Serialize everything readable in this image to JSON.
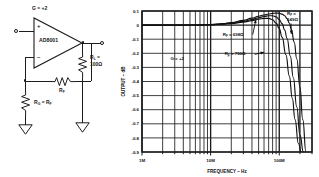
{
  "figure": {
    "kind": "datasheet-figure",
    "circuit": {
      "device_label": "AD8001",
      "gain_label": "G = +2",
      "input_terminal": "IN",
      "output_terminal": "OUT",
      "plus_label": "+",
      "minus_label": "–",
      "rf_label_main": "R",
      "rf_label_sub": "F",
      "rg_label": "R",
      "rg_label_sub": "G",
      "rg_equals": " = R",
      "rg_equals_sub": "F",
      "rl_label": "R",
      "rl_label_sub": "L",
      "rl_value_line1": " =",
      "rl_value_line2": "100Ω"
    }
  },
  "chart_data": {
    "type": "line",
    "title": "",
    "xlabel": "FREQUENCY – Hz",
    "ylabel": "OUTPUT – dB",
    "xscale": "log",
    "xlim": [
      1000000,
      300000000
    ],
    "ylim": [
      -0.9,
      0.1
    ],
    "grid": true,
    "legend": "inline-annotations",
    "annotations": [
      {
        "text_main": "G = +2",
        "x": 2600000,
        "y": -0.25,
        "arrow": false
      },
      {
        "text_main": "R",
        "text_sub": "F",
        "text_rest": " = 698Ω",
        "x": 15000000,
        "y": -0.075,
        "arrow": true,
        "arrow_to_x": 46000000,
        "arrow_to_y": 0.045
      },
      {
        "text_main": "R",
        "text_sub": "F",
        "text_rest": " = 750Ω",
        "x": 16000000,
        "y": -0.215,
        "arrow": true,
        "arrow_to_x": 62000000,
        "arrow_to_y": -0.19
      },
      {
        "text_main": "R",
        "text_sub": "F",
        "text_rest": " =",
        "text_line2": "649Ω",
        "x": 130000000,
        "y": 0.075,
        "arrow": true,
        "arrow_to_x": 150000000,
        "arrow_to_y": -0.07
      }
    ],
    "ytick_labels": [
      "0.1",
      "0",
      "-0.1",
      "-0.2",
      "-0.3",
      "-0.4",
      "-0.5",
      "-0.6",
      "-0.7",
      "-0.8",
      "-0.9"
    ],
    "ytick_values": [
      0.1,
      0.0,
      -0.1,
      -0.2,
      -0.3,
      -0.4,
      -0.5,
      -0.6,
      -0.7,
      -0.8,
      -0.9
    ],
    "xtick_labels": [
      "1M",
      "10M",
      "100M"
    ],
    "xtick_values": [
      1000000,
      10000000,
      100000000
    ],
    "series": [
      {
        "name": "RF = 649Ω",
        "x": [
          1000000,
          2000000,
          4000000,
          7000000,
          10000000,
          15000000,
          20000000,
          30000000,
          40000000,
          50000000,
          60000000,
          70000000,
          80000000,
          90000000,
          100000000,
          110000000,
          120000000,
          130000000,
          140000000,
          150000000,
          165000000,
          180000000,
          200000000,
          220000000,
          245000000
        ],
        "y": [
          0.0,
          0.0,
          0.0,
          0.002,
          0.004,
          0.01,
          0.018,
          0.034,
          0.05,
          0.063,
          0.072,
          0.079,
          0.083,
          0.085,
          0.084,
          0.078,
          0.066,
          0.046,
          0.015,
          -0.03,
          -0.12,
          -0.24,
          -0.44,
          -0.67,
          -0.9
        ]
      },
      {
        "name": "RF = 698Ω",
        "x": [
          1000000,
          2000000,
          4000000,
          7000000,
          10000000,
          15000000,
          20000000,
          30000000,
          40000000,
          50000000,
          60000000,
          70000000,
          80000000,
          90000000,
          100000000,
          110000000,
          120000000,
          130000000,
          145000000,
          160000000,
          180000000,
          200000000,
          225000000
        ],
        "y": [
          0.0,
          0.0,
          0.0,
          0.001,
          0.003,
          0.008,
          0.014,
          0.026,
          0.04,
          0.052,
          0.061,
          0.066,
          0.066,
          0.058,
          0.04,
          0.01,
          -0.035,
          -0.095,
          -0.22,
          -0.37,
          -0.58,
          -0.78,
          -0.9
        ]
      },
      {
        "name": "RF = 750Ω",
        "x": [
          1000000,
          2000000,
          4000000,
          7000000,
          10000000,
          15000000,
          20000000,
          30000000,
          40000000,
          50000000,
          60000000,
          70000000,
          80000000,
          90000000,
          100000000,
          110000000,
          125000000,
          140000000,
          155000000,
          170000000,
          190000000,
          210000000
        ],
        "y": [
          0.0,
          0.0,
          0.0,
          0.001,
          0.002,
          0.006,
          0.011,
          0.021,
          0.032,
          0.042,
          0.048,
          0.048,
          0.038,
          0.014,
          -0.025,
          -0.085,
          -0.21,
          -0.36,
          -0.52,
          -0.67,
          -0.84,
          -0.9
        ]
      }
    ]
  }
}
